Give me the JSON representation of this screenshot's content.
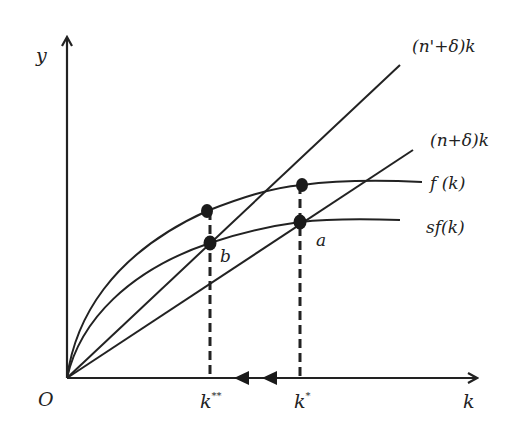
{
  "diagram": {
    "colors": {
      "line": "#222222",
      "background": "#ffffff"
    },
    "axes": {
      "y_label": "y",
      "x_label": "k",
      "origin_label": "O"
    },
    "curves": {
      "high_depreciation_line": "(n'+δ)k",
      "depreciation_line": "(n+δ)k",
      "production": "f (k)",
      "savings": "sf(k)"
    },
    "points": {
      "a": "a",
      "b": "b"
    },
    "ticks": {
      "k_double_star": "k",
      "k_double_star_sup": "**",
      "k_star": "k",
      "k_star_sup": "*"
    },
    "arrows": {
      "direction": "leftward movement from k* to k**",
      "count": 2
    }
  }
}
